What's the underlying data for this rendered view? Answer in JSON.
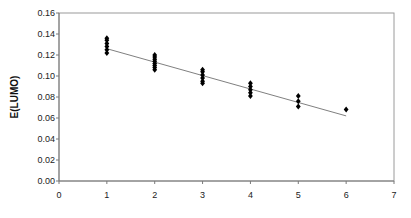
{
  "chart_data": {
    "type": "scatter",
    "title": "",
    "xlabel": "",
    "ylabel": "E(LUMO)",
    "xlim": [
      0,
      7
    ],
    "ylim": [
      0.0,
      0.16
    ],
    "x_ticks": [
      "0",
      "1",
      "2",
      "3",
      "4",
      "5",
      "6",
      "7"
    ],
    "y_ticks": [
      "0.00",
      "0.02",
      "0.04",
      "0.06",
      "0.08",
      "0.10",
      "0.12",
      "0.14",
      "0.16"
    ],
    "grid": false,
    "legend": null,
    "series": [
      {
        "name": "E(LUMO)",
        "marker": "diamond",
        "color": "#000000",
        "points": [
          [
            1,
            0.122
          ],
          [
            1,
            0.125
          ],
          [
            1,
            0.128
          ],
          [
            1,
            0.131
          ],
          [
            1,
            0.134
          ],
          [
            1,
            0.136
          ],
          [
            2,
            0.106
          ],
          [
            2,
            0.108
          ],
          [
            2,
            0.11
          ],
          [
            2,
            0.112
          ],
          [
            2,
            0.114
          ],
          [
            2,
            0.116
          ],
          [
            2,
            0.118
          ],
          [
            2,
            0.12
          ],
          [
            3,
            0.093
          ],
          [
            3,
            0.095
          ],
          [
            3,
            0.098
          ],
          [
            3,
            0.101
          ],
          [
            3,
            0.104
          ],
          [
            3,
            0.106
          ],
          [
            4,
            0.081
          ],
          [
            4,
            0.084
          ],
          [
            4,
            0.087
          ],
          [
            4,
            0.09
          ],
          [
            4,
            0.093
          ],
          [
            5,
            0.071
          ],
          [
            5,
            0.076
          ],
          [
            5,
            0.081
          ],
          [
            6,
            0.068
          ]
        ]
      }
    ],
    "trendline": {
      "type": "linear",
      "color": "#808080",
      "x": [
        1,
        6
      ],
      "y": [
        0.126,
        0.062
      ]
    }
  }
}
